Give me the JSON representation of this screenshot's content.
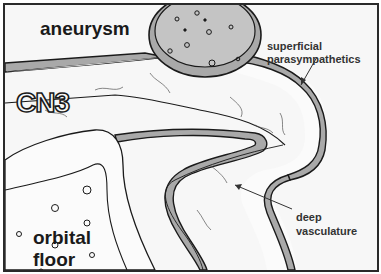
{
  "diagram": {
    "labels": {
      "aneurysm": "aneurysm",
      "cn3": "CN3",
      "superficial_line1": "superficial",
      "superficial_line2": "parasympathetics",
      "deep_line1": "deep",
      "deep_line2": "vasculature",
      "orbital_line1": "orbital",
      "orbital_line2": "floor"
    },
    "colors": {
      "background": "#f7f7f7",
      "outline": "#1a1a1a",
      "aneurysm_fill": "#c4c4c4",
      "parasympathetic_band": "#a9a9a9",
      "nerve_fill": "#fbfbfb"
    }
  }
}
